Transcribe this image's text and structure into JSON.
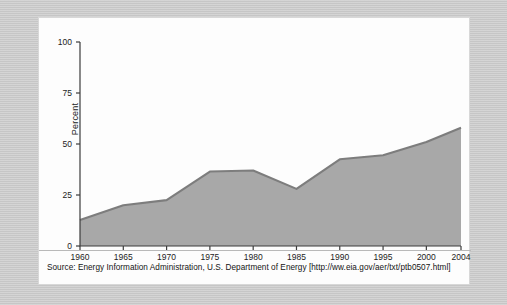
{
  "figure": {
    "source_note": "Source: Energy Information Administration, U.S. Department of Energy [http://ww.eia.gov/aer/txt/ptb0507.html]",
    "frame_color": "#c9c9c9",
    "panel_color": "#fdfdfd"
  },
  "chart_data": {
    "type": "area",
    "title": "",
    "xlabel": "",
    "ylabel": "Percent",
    "x": [
      1960,
      1965,
      1970,
      1975,
      1980,
      1985,
      1990,
      1995,
      2000,
      2004
    ],
    "values": [
      12.7,
      20.0,
      22.5,
      36.5,
      37.0,
      28.0,
      42.5,
      44.5,
      51.0,
      58.0
    ],
    "xtick_labels": [
      "1960",
      "1965",
      "1970",
      "1975",
      "1980",
      "1985",
      "1990",
      "1995",
      "2000",
      "2004"
    ],
    "ytick_labels": [
      "0",
      "25",
      "50",
      "75",
      "100"
    ],
    "yticks": [
      0,
      25,
      50,
      75,
      100
    ],
    "xlim": [
      1960,
      2004
    ],
    "ylim": [
      0,
      100
    ],
    "grid": false,
    "legend": "none",
    "series_name": "Percent",
    "fill_color": "#a8a8a8",
    "line_color": "#7d7d7d",
    "axis_color": "#3c3c3c"
  }
}
